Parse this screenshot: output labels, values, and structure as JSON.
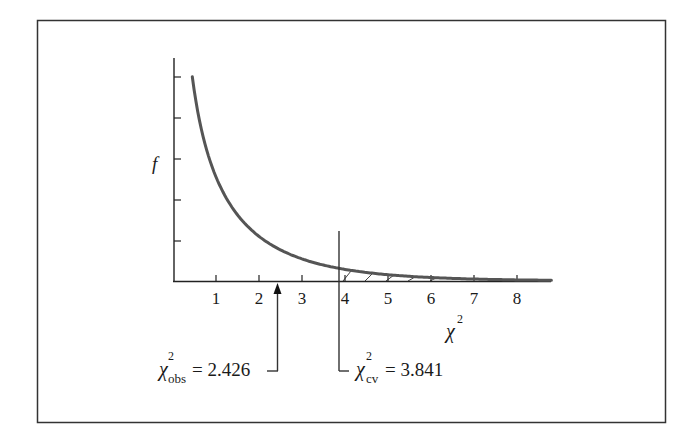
{
  "chart_data": {
    "type": "line",
    "title": "",
    "distribution": "chi-square, df = 1",
    "xlabel": "χ",
    "xlabel_superscript": "2",
    "ylabel": "f",
    "x_ticks": [
      1,
      2,
      3,
      4,
      5,
      6,
      7,
      8
    ],
    "x_tick_labels": [
      "1",
      "2",
      "3",
      "4",
      "5",
      "6",
      "7",
      "8"
    ],
    "y_tick_count": 5,
    "xlim": [
      0,
      8.8
    ],
    "ylim": [
      0,
      0.5
    ],
    "grid": false,
    "series": [
      {
        "name": "chi-square density",
        "x": [
          0.45,
          0.6,
          0.8,
          1.0,
          1.25,
          1.5,
          2.0,
          2.5,
          3.0,
          3.5,
          4.0,
          4.5,
          5.0,
          6.0,
          7.0,
          8.0,
          8.8
        ],
        "y": [
          0.475,
          0.38,
          0.301,
          0.242,
          0.192,
          0.154,
          0.104,
          0.072,
          0.051,
          0.037,
          0.027,
          0.02,
          0.015,
          0.008,
          0.005,
          0.003,
          0.002
        ]
      }
    ],
    "annotations": [
      {
        "type": "arrow",
        "x": 2.426,
        "label_symbol": "χ",
        "label_sup": "2",
        "label_sub": "obs",
        "label_value": "= 2.426"
      },
      {
        "type": "vline",
        "x": 3.841,
        "label_symbol": "χ",
        "label_sup": "2",
        "label_sub": "cv",
        "label_value": "= 3.841"
      },
      {
        "type": "shaded_region",
        "from": 3.841,
        "to": 8.8,
        "style": "hatched",
        "meaning": "rejection region"
      }
    ]
  },
  "labels": {
    "y_axis": "f",
    "x_axis_symbol": "χ",
    "x_axis_sup": "2",
    "obs_symbol": "χ",
    "obs_sup": "2",
    "obs_sub": "obs",
    "obs_value": "= 2.426",
    "cv_symbol": "χ",
    "cv_sup": "2",
    "cv_sub": "cv",
    "cv_value": "= 3.841",
    "tick_1": "1",
    "tick_2": "2",
    "tick_3": "3",
    "tick_4": "4",
    "tick_5": "5",
    "tick_6": "6",
    "tick_7": "7",
    "tick_8": "8"
  },
  "colors": {
    "curve": "#555555",
    "axes": "#222222",
    "frame": "#333333"
  }
}
